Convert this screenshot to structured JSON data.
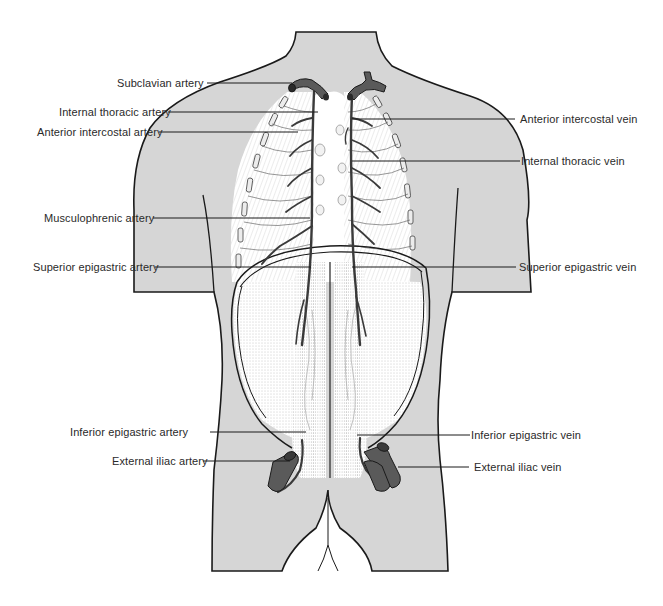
{
  "diagram": {
    "colors": {
      "body_fill": "#d6d6d6",
      "outline": "#1a1a1a",
      "vessel": "#5a5a5a",
      "vessel_dark": "#3a3a3a",
      "label_text": "#2a2a2a",
      "leader_line": "#1a1a1a"
    },
    "labels": {
      "left": [
        {
          "id": "subclavian_artery",
          "text": "Subclavian artery"
        },
        {
          "id": "internal_thoracic_artery",
          "text": "Internal thoracic artery"
        },
        {
          "id": "anterior_intercostal_artery",
          "text": "Anterior intercostal artery"
        },
        {
          "id": "musculophrenic_artery",
          "text": "Musculophrenic artery"
        },
        {
          "id": "superior_epigastric_artery",
          "text": "Superior epigastric artery"
        },
        {
          "id": "inferior_epigastric_artery",
          "text": "Inferior epigastric artery"
        },
        {
          "id": "external_iliac_artery",
          "text": "External iliac artery"
        }
      ],
      "right": [
        {
          "id": "anterior_intercostal_vein",
          "text": "Anterior intercostal vein"
        },
        {
          "id": "internal_thoracic_vein",
          "text": "Internal thoracic vein"
        },
        {
          "id": "superior_epigastric_vein",
          "text": "Superior epigastric vein"
        },
        {
          "id": "inferior_epigastric_vein",
          "text": "Inferior epigastric vein"
        },
        {
          "id": "external_iliac_vein",
          "text": "External iliac vein"
        }
      ]
    }
  }
}
